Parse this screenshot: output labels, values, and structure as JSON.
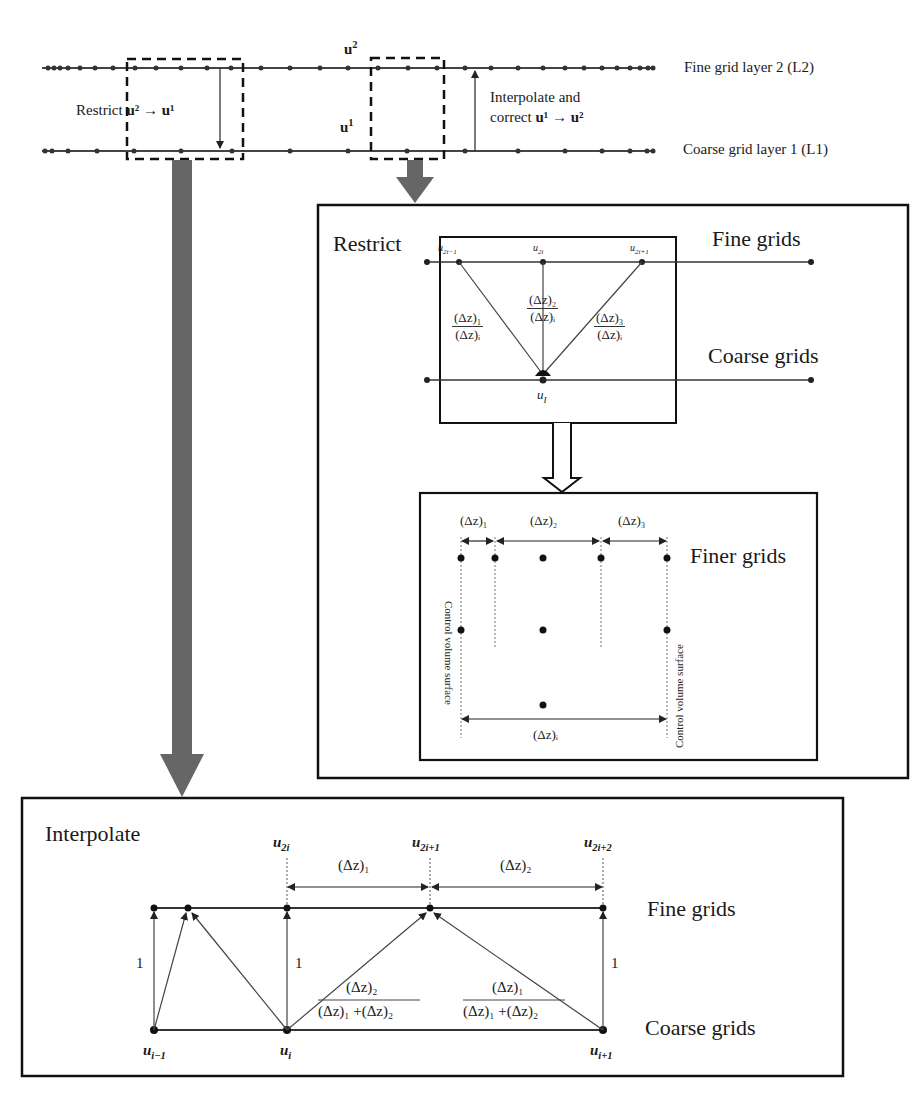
{
  "overview": {
    "fine_layer_label": "Fine grid layer 2 (L2)",
    "coarse_layer_label": "Coarse grid layer 1 (L1)",
    "u2_label": "u",
    "u2_sup": "2",
    "u1_label": "u",
    "u1_sup": "1",
    "restrict_text": "Restrict",
    "restrict_expr": "u² → u¹",
    "interpolate_line1": "Interpolate and",
    "interpolate_line2": "correct",
    "interpolate_expr": "u¹ → u²"
  },
  "restrict_panel": {
    "title": "Restrict",
    "fine_label": "Fine grids",
    "coarse_label": "Coarse grids",
    "node_u2i_minus1": "u",
    "node_u2i_minus1_sub": "2i−1",
    "node_u2i": "u",
    "node_u2i_sub": "2i",
    "node_u2i_plus1": "u",
    "node_u2i_plus1_sub": "2i+1",
    "node_ui": "u",
    "node_ui_sub": "I",
    "weight_left_num": "(Δz)₁",
    "weight_left_den": "(Δz)ᵢ",
    "weight_mid_num": "(Δz)₂",
    "weight_mid_den": "(Δz)ᵢ",
    "weight_right_num": "(Δz)₃",
    "weight_right_den": "(Δz)ᵢ"
  },
  "finer_panel": {
    "finer_label": "Finer grids",
    "dz1": "(Δz)₁",
    "dz2": "(Δz)₂",
    "dz3": "(Δz)₃",
    "dzi": "(Δz)ᵢ",
    "cv_left": "Control volume surface",
    "cv_right": "Control volume surface"
  },
  "interpolate_panel": {
    "title": "Interpolate",
    "fine_label": "Fine grids",
    "coarse_label": "Coarse grids",
    "u2i": "u",
    "u2i_sub": "2i",
    "u2i1": "u",
    "u2i1_sub": "2i+1",
    "u2i2": "u",
    "u2i2_sub": "2i+2",
    "ui_minus1": "u",
    "ui_minus1_sub": "i−1",
    "ui": "u",
    "ui_sub": "i",
    "ui_plus1": "u",
    "ui_plus1_sub": "i+1",
    "dz1": "(Δz)₁",
    "dz2": "(Δz)₂",
    "one_a": "1",
    "one_b": "1",
    "one_c": "1",
    "w_left_num": "(Δz)₂",
    "w_left_den": "(Δz)₁ +(Δz)₂",
    "w_right_num": "(Δz)₁",
    "w_right_den": "(Δz)₁ +(Δz)₂"
  },
  "colors": {
    "line": "#333333",
    "arrow_fill": "#666666",
    "text": "#1a1a1a"
  }
}
